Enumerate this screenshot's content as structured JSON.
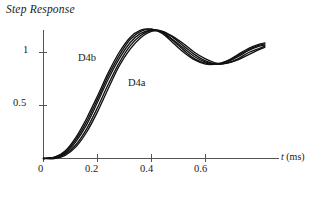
{
  "chart_data": {
    "type": "line",
    "title": "Step Response",
    "xlabel": "t (ms)",
    "ylabel": "",
    "xlim": [
      0,
      0.82
    ],
    "ylim": [
      0,
      1.3
    ],
    "grid": false,
    "legend_position": "inline-annotation",
    "xticks": [
      0,
      0.2,
      0.4,
      0.6
    ],
    "xticklabels": [
      "0",
      "0.2",
      "0.4",
      "0.6"
    ],
    "yticks": [
      0.5,
      1
    ],
    "yticklabels": [
      "0.5",
      "1"
    ],
    "annotations": [
      {
        "text": "D4b",
        "x": 0.13,
        "y": 1.0
      },
      {
        "text": "D4a",
        "x": 0.32,
        "y": 0.76
      }
    ],
    "x": [
      0,
      0.04,
      0.08,
      0.12,
      0.16,
      0.2,
      0.24,
      0.28,
      0.32,
      0.36,
      0.4,
      0.44,
      0.48,
      0.52,
      0.56,
      0.6,
      0.64,
      0.68,
      0.72,
      0.76,
      0.8,
      0.82
    ],
    "series": [
      {
        "name": "D4b-1",
        "values": [
          0,
          0.01,
          0.07,
          0.2,
          0.38,
          0.59,
          0.81,
          1.0,
          1.14,
          1.21,
          1.22,
          1.18,
          1.09,
          1.0,
          0.93,
          0.89,
          0.89,
          0.92,
          0.98,
          1.04,
          1.08,
          1.09
        ]
      },
      {
        "name": "D4b-2",
        "values": [
          0,
          0.01,
          0.06,
          0.18,
          0.35,
          0.56,
          0.78,
          0.97,
          1.12,
          1.2,
          1.22,
          1.19,
          1.11,
          1.02,
          0.94,
          0.9,
          0.89,
          0.92,
          0.97,
          1.03,
          1.07,
          1.08
        ]
      },
      {
        "name": "D4b-3",
        "values": [
          0,
          0.01,
          0.05,
          0.16,
          0.32,
          0.53,
          0.75,
          0.94,
          1.09,
          1.18,
          1.21,
          1.19,
          1.12,
          1.04,
          0.96,
          0.91,
          0.89,
          0.91,
          0.96,
          1.02,
          1.06,
          1.07
        ]
      },
      {
        "name": "D4a-1",
        "values": [
          0,
          0.01,
          0.04,
          0.13,
          0.28,
          0.48,
          0.7,
          0.9,
          1.06,
          1.16,
          1.21,
          1.2,
          1.14,
          1.06,
          0.98,
          0.92,
          0.89,
          0.9,
          0.94,
          1.0,
          1.04,
          1.06
        ]
      },
      {
        "name": "D4a-2",
        "values": [
          0,
          0.0,
          0.03,
          0.11,
          0.25,
          0.44,
          0.66,
          0.87,
          1.03,
          1.14,
          1.2,
          1.2,
          1.15,
          1.08,
          1.0,
          0.94,
          0.9,
          0.9,
          0.93,
          0.98,
          1.03,
          1.05
        ]
      }
    ],
    "colors": {
      "curve": "#111111",
      "axis": "#555555",
      "text": "#1a1a1a"
    }
  },
  "axis": {
    "x_tick_labels": [
      "0",
      "0.2",
      "0.4",
      "0.6"
    ],
    "y_tick_labels": [
      "1",
      "0.5"
    ],
    "x_axis_label": "t (ms)",
    "x_axis_label_symbol": "t",
    "x_axis_label_unit": "(ms)"
  },
  "labels": {
    "title": "Step Response",
    "curve_group_upper": "D4b",
    "curve_group_lower": "D4a"
  }
}
